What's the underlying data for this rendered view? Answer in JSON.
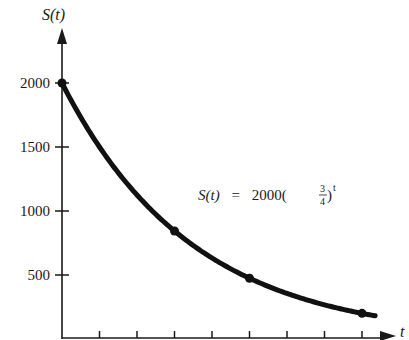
{
  "chart_data": {
    "type": "line",
    "title": "",
    "xlabel": "t",
    "ylabel": "S(t)",
    "annotation": {
      "prefix": "S(t)",
      "equals": "=",
      "coefficient": "2000",
      "base_numerator": "3",
      "base_denominator": "4",
      "exponent": "t",
      "full_text": "S(t) = 2000(3/4)^t"
    },
    "y_ticks": [
      500,
      1000,
      1500,
      2000
    ],
    "y_tick_labels": [
      "500",
      "1000",
      "1500",
      "2000"
    ],
    "x_ticks": [
      1,
      2,
      3,
      4,
      5,
      6,
      7,
      8
    ],
    "x_tick_labels": [],
    "xlim": [
      0,
      8.6
    ],
    "ylim": [
      0,
      2000
    ],
    "grid": false,
    "legend": null,
    "series": [
      {
        "name": "S(t) = 2000(3/4)^t",
        "function": "2000*(0.75)^t",
        "x": [
          0,
          3,
          5,
          8
        ],
        "values": [
          2000,
          843.75,
          474.61,
          200.23
        ],
        "marked_points": true,
        "color": "#111111"
      }
    ]
  }
}
